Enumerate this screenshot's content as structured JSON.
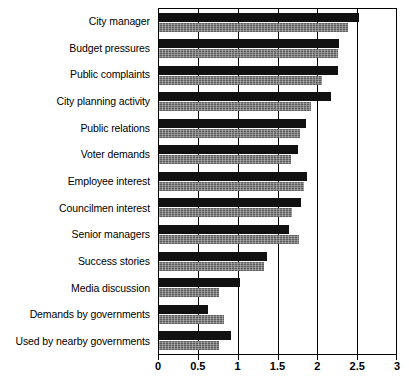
{
  "chart_data": {
    "type": "bar",
    "orientation": "horizontal",
    "title": "",
    "subtitle": "",
    "xlabel": "",
    "ylabel": "",
    "xlim": [
      0,
      3
    ],
    "ylim": null,
    "grid": true,
    "legend": null,
    "legend_position": "none",
    "xticks": [
      0,
      0.5,
      1,
      1.5,
      2,
      2.5,
      3
    ],
    "xtick_labels": [
      "0",
      "0.5",
      "1",
      "1.5",
      "2",
      "2.5",
      "3"
    ],
    "categories": [
      "City manager",
      "Budget pressures",
      "Public complaints",
      "City planning activity",
      "Public relations",
      "Voter demands",
      "Employee interest",
      "Councilmen interest",
      "Senior managers",
      "Success stories",
      "Media discussion",
      "Demands by governments",
      "Used by nearby governments"
    ],
    "series": [
      {
        "name": "series-a",
        "color": "#111111",
        "values": [
          2.51,
          2.26,
          2.25,
          2.16,
          1.85,
          1.74,
          1.86,
          1.78,
          1.63,
          1.35,
          1.02,
          0.61,
          0.91
        ]
      },
      {
        "name": "series-b",
        "color": "#777777",
        "values": [
          2.37,
          2.25,
          2.05,
          1.91,
          1.77,
          1.66,
          1.82,
          1.67,
          1.76,
          1.32,
          0.75,
          0.81,
          0.75
        ]
      }
    ]
  }
}
